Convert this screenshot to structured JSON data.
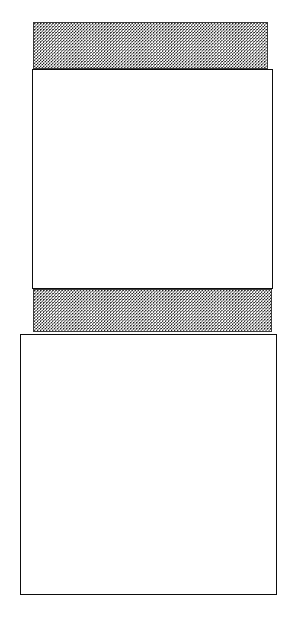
{
  "figure": {
    "canvas": {
      "width": 293,
      "height": 617,
      "background_color": "#ffffff"
    },
    "stroke_color": "#0d0d0d",
    "fill_color": "#ffffff",
    "stipple_dot_color": "#1a1a1a",
    "stipple_background_color": "#fbfbfb"
  },
  "blocks": [
    {
      "id": "band-top",
      "label": "top stippled band",
      "fill_style": "stippled",
      "x": 33,
      "y": 22,
      "width": 235,
      "height": 47
    },
    {
      "id": "slab-upper",
      "label": "upper outlined slab",
      "fill_style": "outlined",
      "x": 32,
      "y": 69,
      "width": 241,
      "height": 220
    },
    {
      "id": "band-middle",
      "label": "middle stippled band",
      "fill_style": "stippled",
      "x": 33,
      "y": 289,
      "width": 239,
      "height": 43
    },
    {
      "id": "slab-lower",
      "label": "lower outlined slab",
      "fill_style": "outlined",
      "x": 20,
      "y": 334,
      "width": 257,
      "height": 261
    }
  ]
}
